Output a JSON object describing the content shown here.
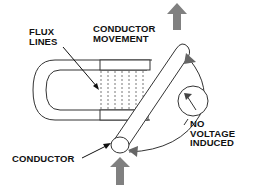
{
  "diagram": {
    "labels": {
      "flux_lines": [
        "FLUX",
        "LINES"
      ],
      "conductor_movement": [
        "CONDUCTOR",
        "MOVEMENT"
      ],
      "no_voltage_induced": [
        "NO",
        "VOLTAGE",
        "INDUCED"
      ],
      "conductor": "CONDUCTOR"
    },
    "colors": {
      "line": "#333333",
      "arrow_fill": "#808080",
      "text": "#111111"
    }
  }
}
